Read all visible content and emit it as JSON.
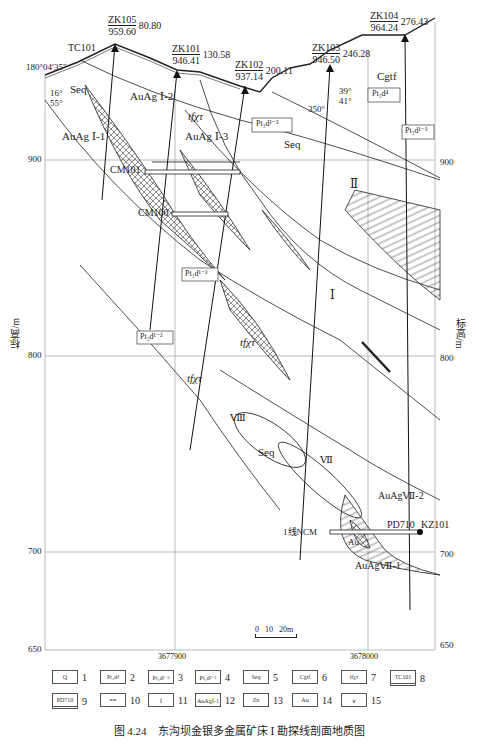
{
  "figure": {
    "caption": "图 4.24　东沟坝金银多金属矿床 Ⅰ 勘探线剖面地质图",
    "y_axis_label": "标高/m",
    "y_ticks": [
      "900",
      "800",
      "700",
      "650"
    ],
    "x_ticks": [
      "3677900",
      "3678000"
    ],
    "start_azimuth": "180°04′35″",
    "scale_bar": "0   10   20m"
  },
  "drillholes": [
    {
      "id": "ZK105",
      "elev": "959.60",
      "depth": "80.80"
    },
    {
      "id": "ZK101",
      "elev": "946.41",
      "depth": "130.58"
    },
    {
      "id": "ZK102",
      "elev": "937.14",
      "depth": "200.11"
    },
    {
      "id": "ZK103",
      "elev": "946.50",
      "depth": "246.28"
    },
    {
      "id": "ZK104",
      "elev": "964.24",
      "depth": "276.43"
    }
  ],
  "labels": {
    "tc101": "TC101",
    "seq": "Seq",
    "cgtf": "Cgtf",
    "tfxt": "tfχτ",
    "aug1_1": "AuAg Ⅰ-1",
    "aug1_2": "AuAg Ⅰ-2",
    "aug1_3": "AuAg Ⅰ-3",
    "aug7_1": "AuAgⅦ-1",
    "aug7_2": "AuAgⅦ-2",
    "au": "Au",
    "cm101": "CM101",
    "cm100": "CM100",
    "ncm": "1线NCM",
    "pd710": "PD710",
    "kz101": "KZ101",
    "zone_1": "Ⅰ",
    "zone_2": "Ⅱ",
    "zone_7": "Ⅶ",
    "zone_8": "Ⅷ",
    "pt_d4": "Pt₃d⁴",
    "pt_d13": "Pt₃d¹⁻³",
    "pt_d12": "Pt₃d¹⁻²",
    "dip1_a": "16°",
    "dip1_b": "55°",
    "dip2_a": "39°",
    "dip2_b": "41°",
    "dip3": "350°"
  },
  "legend": [
    {
      "box": "Q",
      "num": "1"
    },
    {
      "box": "Pt₃d⁴",
      "num": "2"
    },
    {
      "box": "Pt₃d¹⁻³",
      "num": "3"
    },
    {
      "box": "Pt₃d¹⁻²",
      "num": "4"
    },
    {
      "box": "Seq",
      "num": "5"
    },
    {
      "box": "Cgtf",
      "num": "6"
    },
    {
      "box": "tfχτ",
      "num": "7"
    },
    {
      "box": "TC101",
      "num": "8"
    },
    {
      "box": "PD710",
      "num": "9"
    },
    {
      "box": "≡≡",
      "num": "10"
    },
    {
      "box": "Ⅰ",
      "num": "11"
    },
    {
      "box": "AuAgⅠ-1",
      "num": "12"
    },
    {
      "box": "Zn",
      "num": "13"
    },
    {
      "box": "Au",
      "num": "14"
    },
    {
      "box": "∨",
      "num": "15"
    }
  ]
}
